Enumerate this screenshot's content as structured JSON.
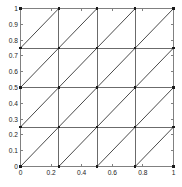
{
  "figure": {
    "background_color": "#ffffff",
    "axes_color": "#808080",
    "mesh_line_color": "#6b6b6b",
    "diagonal_color": "#4a4a4a",
    "node_color": "#1a1a1a",
    "tick_label_color": "#222222"
  },
  "chart_data": {
    "type": "line",
    "title": "",
    "xlabel": "",
    "ylabel": "",
    "xlim": [
      0,
      1
    ],
    "ylim": [
      0,
      1
    ],
    "grid": false,
    "legend": null,
    "x_tick_labels": [
      "0",
      "0.2",
      "0.4",
      "0.6",
      "0.8",
      "1"
    ],
    "x_tick_values": [
      0,
      0.2,
      0.4,
      0.6,
      0.8,
      1
    ],
    "y_tick_labels": [
      "0",
      "0.1",
      "0.2",
      "0.3",
      "0.4",
      "0.5",
      "0.6",
      "0.7",
      "0.8",
      "0.9",
      "1"
    ],
    "y_tick_values": [
      0,
      0.1,
      0.2,
      0.3,
      0.4,
      0.5,
      0.6,
      0.7,
      0.8,
      0.9,
      1
    ],
    "mesh": {
      "description": "Structured triangular mesh on the unit square",
      "divisions_x": 4,
      "divisions_y": 4,
      "cell_size": 0.25,
      "grid_coordinates": [
        0,
        0.25,
        0.5,
        0.75,
        1
      ],
      "diagonal_direction": "bottom-left-to-top-right",
      "triangle_count": 32,
      "node_count": 25,
      "nodes": [
        [
          0,
          0
        ],
        [
          0.25,
          0
        ],
        [
          0.5,
          0
        ],
        [
          0.75,
          0
        ],
        [
          1,
          0
        ],
        [
          0,
          0.25
        ],
        [
          0.25,
          0.25
        ],
        [
          0.5,
          0.25
        ],
        [
          0.75,
          0.25
        ],
        [
          1,
          0.25
        ],
        [
          0,
          0.5
        ],
        [
          0.25,
          0.5
        ],
        [
          0.5,
          0.5
        ],
        [
          0.75,
          0.5
        ],
        [
          1,
          0.5
        ],
        [
          0,
          0.75
        ],
        [
          0.25,
          0.75
        ],
        [
          0.5,
          0.75
        ],
        [
          0.75,
          0.75
        ],
        [
          1,
          0.75
        ],
        [
          0,
          1
        ],
        [
          0.25,
          1
        ],
        [
          0.5,
          1
        ],
        [
          0.75,
          1
        ],
        [
          1,
          1
        ]
      ]
    }
  }
}
